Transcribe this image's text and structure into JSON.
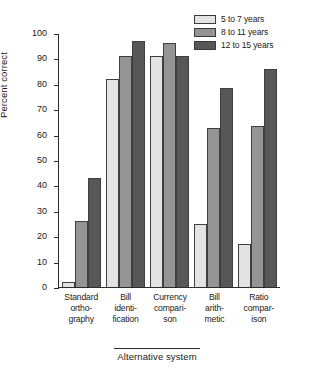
{
  "chart_data": {
    "type": "bar",
    "title": "",
    "xlabel": "Alternative system",
    "ylabel": "Percent correct",
    "ylim": [
      0,
      100
    ],
    "ytick_step": 10,
    "yticks": [
      100,
      90,
      80,
      70,
      60,
      50,
      40,
      30,
      20,
      10,
      0
    ],
    "grid": false,
    "legend_position": "top-right",
    "categories": [
      "Standard orthography",
      "Bill identification",
      "Currency comparison",
      "Bill arithmetic",
      "Ratio comparison"
    ],
    "category_lines": [
      [
        "Standard",
        "ortho-",
        "graphy"
      ],
      [
        "Bill",
        "identi-",
        "fication"
      ],
      [
        "Currency",
        "compari-",
        "son"
      ],
      [
        "Bill",
        "arith-",
        "metic"
      ],
      [
        "Ratio",
        "compar-",
        "ison"
      ]
    ],
    "series": [
      {
        "name": "5 to 7 years",
        "color": "#e3e3e3",
        "values": [
          2,
          82,
          91,
          25,
          17
        ]
      },
      {
        "name": "8 to 11 years",
        "color": "#949494",
        "values": [
          26,
          91,
          96,
          62.5,
          63.5
        ]
      },
      {
        "name": "12 to 15 years",
        "color": "#575757",
        "values": [
          43,
          97,
          91,
          78.5,
          86
        ]
      }
    ]
  }
}
